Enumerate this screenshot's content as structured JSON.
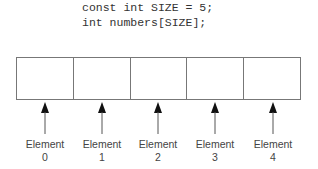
{
  "code": {
    "lines": [
      "const int SIZE = 5;",
      "int numbers[SIZE];"
    ]
  },
  "array": {
    "size": 5,
    "border_color": "#777777",
    "cells": [
      {
        "label": "Element",
        "index": "0"
      },
      {
        "label": "Element",
        "index": "1"
      },
      {
        "label": "Element",
        "index": "2"
      },
      {
        "label": "Element",
        "index": "3"
      },
      {
        "label": "Element",
        "index": "4"
      }
    ]
  }
}
